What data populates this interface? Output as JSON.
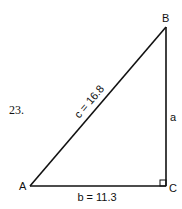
{
  "problem": {
    "number": "23."
  },
  "triangle": {
    "vertices": {
      "A": {
        "label": "A",
        "x": 30,
        "y": 186
      },
      "B": {
        "label": "B",
        "x": 166,
        "y": 27
      },
      "C": {
        "label": "C",
        "x": 166,
        "y": 186
      }
    },
    "sides": {
      "c": {
        "label": "c = 16.8",
        "from": "A",
        "to": "B"
      },
      "b": {
        "label": "b = 11.3",
        "from": "A",
        "to": "C"
      },
      "a": {
        "label": "a",
        "from": "B",
        "to": "C"
      }
    },
    "right_angle_at": "C"
  },
  "colors": {
    "stroke": "#111111",
    "background": "#ffffff"
  }
}
